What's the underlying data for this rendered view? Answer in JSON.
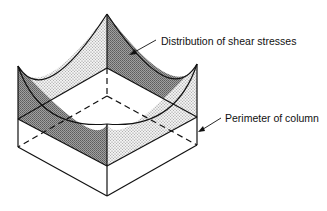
{
  "diagram": {
    "labels": {
      "shear": "Distribution of shear stresses",
      "perimeter": "Perimeter of column"
    },
    "colors": {
      "line": "#111111",
      "dark_fill": "#8c8c8c",
      "light_fill": "#dcdcdc",
      "background": "#ffffff"
    }
  }
}
